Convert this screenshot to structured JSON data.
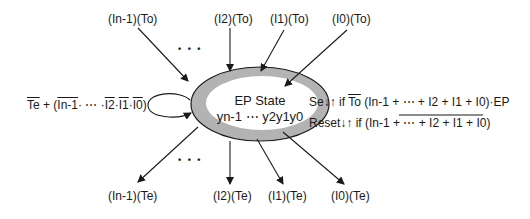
{
  "state": {
    "name": "EP State",
    "bits": "yn-1 ⋯ y2y1y0"
  },
  "inputs_to": [
    "(In-1)(To)",
    "(I2)(To)",
    "(I1)(To)",
    "(I0)(To)"
  ],
  "outputs_te": [
    "(In-1)(Te)",
    "(I2)(Te)",
    "(I1)(Te)",
    "(I0)(Te)"
  ],
  "ellipsis": "• • •",
  "self_loop": {
    "te": "Te",
    "plus_open": " + (",
    "in1": "In-1",
    "mid": "·  ⋯  ·",
    "i2": "I2",
    "dot1": "·",
    "i1": "I1",
    "dot2": "·",
    "i0": "I0",
    "close": ")"
  },
  "set_rule": {
    "prefix": "Se↓↑ if ",
    "to": "To",
    "expr": " (In-1 + ⋯ + I2 + I1 + I0)·EP"
  },
  "reset_rule": {
    "prefix": "Reset↓↑ if (",
    "expr": "In-1 + ⋯ + I2 + I1 + I0",
    "close": ")"
  },
  "colors": {
    "ring": "#b3b3b3",
    "line": "#1a1a1a",
    "background": "#ffffff"
  }
}
